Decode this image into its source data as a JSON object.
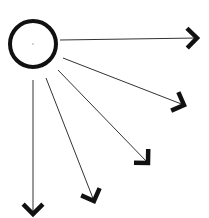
{
  "diagram": {
    "type": "radiating-arrows",
    "background": "#ffffff",
    "stroke_color": "#111111",
    "source": {
      "shape": "circle",
      "cx": 33,
      "cy": 44,
      "r": 23,
      "stroke_width": 4
    },
    "arrows": [
      {
        "id": "arrow-right",
        "x1": 60,
        "y1": 40,
        "x2": 197,
        "y2": 38
      },
      {
        "id": "arrow-down-right-shallow",
        "x1": 63,
        "y1": 58,
        "x2": 184,
        "y2": 105
      },
      {
        "id": "arrow-down-right-mid",
        "x1": 58,
        "y1": 70,
        "x2": 148,
        "y2": 163
      },
      {
        "id": "arrow-down-right-steep",
        "x1": 46,
        "y1": 78,
        "x2": 94,
        "y2": 201
      },
      {
        "id": "arrow-down",
        "x1": 33,
        "y1": 80,
        "x2": 33,
        "y2": 214
      }
    ]
  }
}
